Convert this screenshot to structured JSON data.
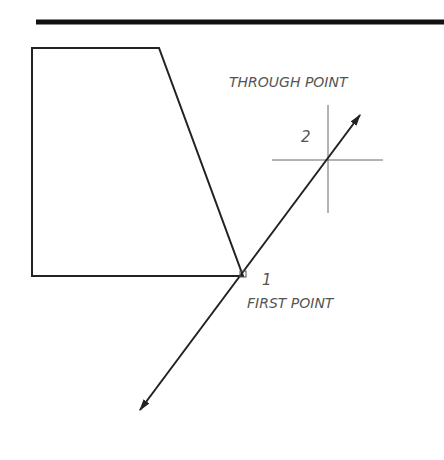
{
  "diagram": {
    "type": "cad-ray-construction",
    "labels": {
      "through_point": "THROUGH POINT",
      "first_point": "FIRST POINT",
      "point_1_number": "1",
      "point_2_number": "2"
    },
    "colors": {
      "line": "#222222",
      "text": "#555555",
      "crosshair": "#666666",
      "background": "#ffffff"
    },
    "geometry": {
      "header_rule": {
        "x1": 36,
        "y1": 22,
        "x2": 444,
        "y2": 22
      },
      "shape_polygon": [
        [
          32,
          48
        ],
        [
          159,
          48
        ],
        [
          243,
          276
        ],
        [
          32,
          276
        ]
      ],
      "first_point": [
        243,
        274
      ],
      "through_point": [
        328,
        160
      ],
      "ray_start_tip": [
        140,
        410
      ],
      "ray_end_tip": [
        360,
        115
      ]
    }
  }
}
